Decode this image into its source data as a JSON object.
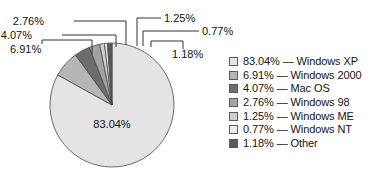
{
  "chart_data": {
    "type": "pie",
    "title": "",
    "subtitle": "",
    "xlabel": "",
    "ylabel": "",
    "grid": false,
    "legend_position": "right",
    "units": "percent",
    "start_angle_deg": 0,
    "direction": "clockwise",
    "center_label": "83.04%",
    "categories": [
      "Windows XP",
      "Windows 2000",
      "Mac OS",
      "Windows 98",
      "Windows ME",
      "Windows NT",
      "Other"
    ],
    "values": [
      83.04,
      6.91,
      4.07,
      2.76,
      1.25,
      0.77,
      1.18
    ],
    "value_labels": [
      "83.04%",
      "6.91%",
      "4.07%",
      "2.76%",
      "1.25%",
      "0.77%",
      "1.18%"
    ],
    "colors": [
      "#e4e4e4",
      "#b6b6b6",
      "#6d6d6d",
      "#a3a3a3",
      "#cfcfcf",
      "#ededed",
      "#5a5a5a"
    ],
    "slices": [
      {
        "label": "Windows XP",
        "value": 83.04,
        "value_label": "83.04%",
        "color": "#e4e4e4"
      },
      {
        "label": "Windows 2000",
        "value": 6.91,
        "value_label": "6.91%",
        "color": "#b6b6b6"
      },
      {
        "label": "Mac OS",
        "value": 4.07,
        "value_label": "4.07%",
        "color": "#6d6d6d"
      },
      {
        "label": "Windows 98",
        "value": 2.76,
        "value_label": "2.76%",
        "color": "#a3a3a3"
      },
      {
        "label": "Windows ME",
        "value": 1.25,
        "value_label": "1.25%",
        "color": "#cfcfcf"
      },
      {
        "label": "Windows NT",
        "value": 0.77,
        "value_label": "0.77%",
        "color": "#ededed"
      },
      {
        "label": "Other",
        "value": 1.18,
        "value_label": "1.18%",
        "color": "#5a5a5a"
      }
    ]
  },
  "callouts": {
    "left": [
      {
        "text": "2.76%"
      },
      {
        "text": "4.07%"
      },
      {
        "text": "6.91%"
      }
    ],
    "right": [
      {
        "text": "1.25%"
      },
      {
        "text": "0.77%"
      },
      {
        "text": "1.18%"
      }
    ]
  },
  "center": {
    "label": "83.04%"
  },
  "legend": {
    "separator": "—",
    "items": [
      {
        "value_label": "83.04%",
        "name": "Windows XP",
        "text": "83.04% — Windows XP",
        "color": "#e4e4e4"
      },
      {
        "value_label": "6.91%",
        "name": "Windows 2000",
        "text": "6.91% — Windows 2000",
        "color": "#b6b6b6"
      },
      {
        "value_label": "4.07%",
        "name": "Mac OS",
        "text": "4.07% — Mac OS",
        "color": "#6d6d6d"
      },
      {
        "value_label": "2.76%",
        "name": "Windows 98",
        "text": "2.76% — Windows 98",
        "color": "#a3a3a3"
      },
      {
        "value_label": "1.25%",
        "name": "Windows ME",
        "text": "1.25% — Windows ME",
        "color": "#cfcfcf"
      },
      {
        "value_label": "0.77%",
        "name": "Windows NT",
        "text": "0.77% — Windows NT",
        "color": "#ededed"
      },
      {
        "value_label": "1.18%",
        "name": "Other",
        "text": "1.18% — Other",
        "color": "#5a5a5a"
      }
    ]
  },
  "style": {
    "background": "#ffffff",
    "slice_outline": "#4a4a4a",
    "leader_line": "#333333",
    "text": "#111111"
  }
}
